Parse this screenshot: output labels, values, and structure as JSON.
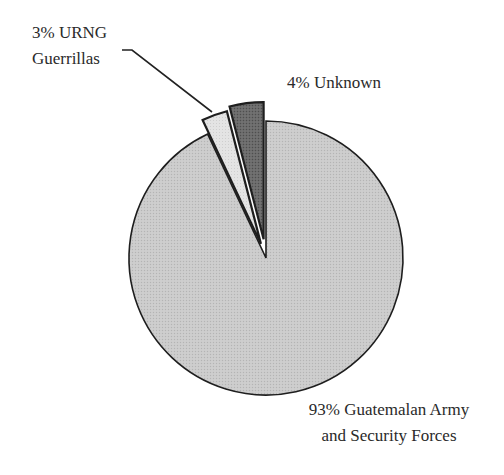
{
  "chart_data": {
    "type": "pie",
    "title": "",
    "categories": [
      "Guatemalan Army and Security Forces",
      "URNG Guerrillas",
      "Unknown"
    ],
    "values": [
      93,
      3,
      4
    ],
    "series": [
      {
        "name": "Responsibility",
        "values": [
          93,
          3,
          4
        ]
      }
    ],
    "labels": [
      {
        "line1": "93% Guatemalan Army",
        "line2": "and Security Forces"
      },
      {
        "line1": "3% URNG",
        "line2": "Guerrillas"
      },
      {
        "line1": "4% Unknown",
        "line2": ""
      }
    ],
    "colors": [
      "#c8c8c8",
      "#e6e6e6",
      "#6e6e6e"
    ],
    "exploded": [
      false,
      true,
      true
    ],
    "legend": "none (direct labels)",
    "grid": false
  }
}
